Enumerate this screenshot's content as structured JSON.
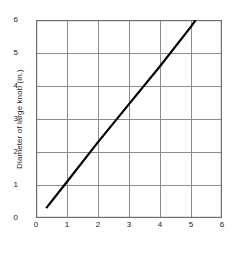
{
  "chart_data": {
    "type": "line",
    "title": "",
    "xlabel": "Diameter of small knob (in.)",
    "ylabel": "Diameter of large knob (in.)",
    "xlim": [
      0,
      6
    ],
    "ylim": [
      0,
      6
    ],
    "xticks": [
      "0",
      "1",
      "2",
      "3",
      "4",
      "5",
      "6"
    ],
    "yticks": [
      "0",
      "1",
      "2",
      "3",
      "4",
      "5",
      "6"
    ],
    "xtick_values": [
      0,
      1,
      2,
      3,
      4,
      5,
      6
    ],
    "ytick_values": [
      0,
      1,
      2,
      3,
      4,
      5,
      6
    ],
    "grid": true,
    "legend": null,
    "series": [
      {
        "name": "knob diameter relation",
        "color": "#000000",
        "x": [
          0.33,
          1.0,
          2.0,
          3.0,
          4.0,
          5.0,
          5.15
        ],
        "y": [
          0.3,
          1.1,
          2.3,
          3.45,
          4.6,
          5.8,
          6.0
        ]
      }
    ],
    "line_endpoints": {
      "start": [
        0.33,
        0.3
      ],
      "end": [
        5.15,
        6.0
      ]
    },
    "slope": 1.2,
    "colors": {
      "line": "#000000",
      "grid": "#8c8c8c",
      "frame": "#6e6e6e",
      "background": "#ffffff",
      "text": "#1a1a1a"
    }
  }
}
